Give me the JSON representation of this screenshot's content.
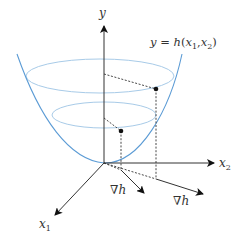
{
  "diagram": {
    "type": "gradient-of-surface illustration",
    "colors": {
      "surface": "#5b9bd5",
      "contour": "#a8cbe8",
      "axis": "#333333",
      "dashed": "#333333",
      "point": "#111111"
    },
    "axes": {
      "y": {
        "label": "y"
      },
      "x1": {
        "label": "x",
        "sub": "1"
      },
      "x2": {
        "label": "x",
        "sub": "2"
      }
    },
    "function_label": {
      "lhs": "y",
      "eq": " = ",
      "fn": "h",
      "open": "(",
      "a": "x",
      "a_sub": "1",
      "sep": ",",
      "b": "x",
      "b_sub": "2",
      "close": ")"
    },
    "gradient_labels": [
      {
        "nabla": "∇",
        "var": "h"
      },
      {
        "nabla": "∇",
        "var": "h"
      }
    ]
  }
}
